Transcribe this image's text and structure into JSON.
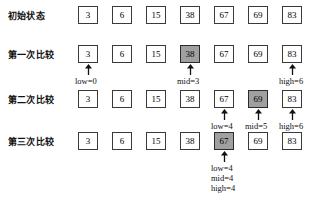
{
  "diagram": {
    "values": [
      3,
      6,
      15,
      38,
      67,
      69,
      83
    ],
    "rows": [
      {
        "label": "初始状态",
        "cells": [
          "3",
          "6",
          "15",
          "38",
          "67",
          "69",
          "83"
        ],
        "highlight_index": -1,
        "arrows": [],
        "pointers": []
      },
      {
        "label": "第一次比较",
        "cells": [
          "3",
          "6",
          "15",
          "38",
          "67",
          "69",
          "83"
        ],
        "highlight_index": 3,
        "arrows": [
          0,
          3,
          6
        ],
        "pointers": [
          {
            "index": 0,
            "lines": [
              "low=0"
            ]
          },
          {
            "index": 3,
            "lines": [
              "mid=3"
            ]
          },
          {
            "index": 6,
            "lines": [
              "high=6"
            ]
          }
        ]
      },
      {
        "label": "第二次比较",
        "cells": [
          "3",
          "6",
          "15",
          "38",
          "67",
          "69",
          "83"
        ],
        "highlight_index": 5,
        "arrows": [
          4,
          5,
          6
        ],
        "pointers": [
          {
            "index": 4,
            "lines": [
              "low=4"
            ]
          },
          {
            "index": 5,
            "lines": [
              "mid=5"
            ]
          },
          {
            "index": 6,
            "lines": [
              "high=6"
            ]
          }
        ]
      },
      {
        "label": "第三次比较",
        "cells": [
          "3",
          "6",
          "15",
          "38",
          "67",
          "69",
          "83"
        ],
        "highlight_index": 4,
        "arrows": [
          4
        ],
        "pointers": [
          {
            "index": 4,
            "lines": [
              "low=4",
              "mid=4",
              "high=4"
            ]
          }
        ]
      }
    ],
    "colors": {
      "highlight_fill": "#a0a0a0",
      "cell_border": "#3a3a3a",
      "text": "#111111",
      "background": "#ffffff"
    },
    "layout": {
      "cell_pitch": 34,
      "cell_width": 20,
      "cell_height": 18,
      "cells_left": 78,
      "row_tops": [
        6,
        45,
        90,
        132
      ]
    }
  }
}
